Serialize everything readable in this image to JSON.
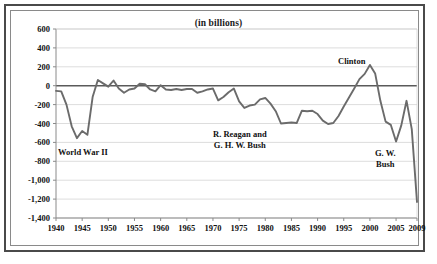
{
  "chart_data": {
    "type": "line",
    "title": "(in billions)",
    "xlabel": "",
    "ylabel": "",
    "grid": true,
    "legend": "none",
    "xlim": [
      1940,
      2009
    ],
    "ylim": [
      -1400,
      600
    ],
    "yticks": [
      "600",
      "400",
      "200",
      "0",
      "-200",
      "-400",
      "-600",
      "-800",
      "-1,000",
      "-1,200",
      "-1,400"
    ],
    "ytick_values": [
      600,
      400,
      200,
      0,
      -200,
      -400,
      -600,
      -800,
      -1000,
      -1200,
      -1400
    ],
    "xticks": [
      "1940",
      "1945",
      "1950",
      "1955",
      "1960",
      "1965",
      "1970",
      "1975",
      "1980",
      "1985",
      "1990",
      "1995",
      "2000",
      "2005",
      "2009"
    ],
    "xtick_values": [
      1940,
      1945,
      1950,
      1955,
      1960,
      1965,
      1970,
      1975,
      1980,
      1985,
      1990,
      1995,
      2000,
      2005,
      2009
    ],
    "series": [
      {
        "name": "Federal surplus or deficit",
        "color": "#6b6b6b",
        "x": [
          1940,
          1941,
          1942,
          1943,
          1944,
          1945,
          1946,
          1947,
          1948,
          1949,
          1950,
          1951,
          1952,
          1953,
          1954,
          1955,
          1956,
          1957,
          1958,
          1959,
          1960,
          1961,
          1962,
          1963,
          1964,
          1965,
          1966,
          1967,
          1968,
          1969,
          1970,
          1971,
          1972,
          1973,
          1974,
          1975,
          1976,
          1977,
          1978,
          1979,
          1980,
          1981,
          1982,
          1983,
          1984,
          1985,
          1986,
          1987,
          1988,
          1989,
          1990,
          1991,
          1992,
          1993,
          1994,
          1995,
          1996,
          1997,
          1998,
          1999,
          2000,
          2001,
          2002,
          2003,
          2004,
          2005,
          2006,
          2007,
          2008,
          2009
        ],
        "values": [
          -55,
          -60,
          -200,
          -430,
          -555,
          -480,
          -520,
          -120,
          60,
          25,
          -10,
          55,
          -30,
          -75,
          -40,
          -30,
          20,
          15,
          -40,
          -60,
          5,
          -40,
          -45,
          -35,
          -45,
          -35,
          -35,
          -75,
          -60,
          -40,
          -30,
          -155,
          -120,
          -70,
          -30,
          -165,
          -235,
          -210,
          -200,
          -145,
          -130,
          -190,
          -270,
          -400,
          -395,
          -390,
          -395,
          -265,
          -270,
          -265,
          -300,
          -370,
          -405,
          -395,
          -320,
          -220,
          -125,
          -30,
          70,
          125,
          220,
          130,
          -160,
          -380,
          -415,
          -590,
          -420,
          -160,
          -460,
          -1230
        ]
      }
    ],
    "annotations": [
      {
        "name": "world-war-ii",
        "lines": [
          "World War II"
        ],
        "x_left": 58,
        "y_top": 147
      },
      {
        "name": "reagan-ghw-bush",
        "lines": [
          "R. Reagan and",
          "G. H. W. Bush"
        ],
        "x_left": 213,
        "y_top": 129
      },
      {
        "name": "clinton",
        "lines": [
          "Clinton"
        ],
        "x_left": 338,
        "y_top": 56
      },
      {
        "name": "gw-bush",
        "lines": [
          "G. W.",
          "Bush"
        ],
        "x_left": 375,
        "y_top": 148
      }
    ],
    "colors": {
      "line": "#6b6b6b",
      "gridline": "#cfcfcf",
      "zero_line": "#5a5a5a",
      "axis": "#8a8a8a",
      "frame_outer": "#4a4a4a",
      "frame_inner": "#8a8a8a",
      "background": "#ffffff",
      "text": "#111111"
    }
  }
}
